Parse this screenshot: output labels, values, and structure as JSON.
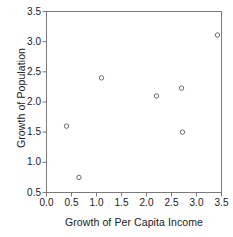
{
  "chart_data": {
    "type": "scatter",
    "title": "",
    "xlabel": "Growth of Per Capita Income",
    "ylabel": "Growth of Population",
    "xlim": [
      0.0,
      3.5
    ],
    "ylim": [
      0.5,
      3.5
    ],
    "xticks": [
      "0.0",
      "0.5",
      "1.0",
      "1.5",
      "2.0",
      "2.5",
      "3.0",
      "3.5"
    ],
    "yticks": [
      "0.5",
      "1.0",
      "1.5",
      "2.0",
      "2.5",
      "3.0",
      "3.5"
    ],
    "xtick_values": [
      0.0,
      0.5,
      1.0,
      1.5,
      2.0,
      2.5,
      3.0,
      3.5
    ],
    "ytick_values": [
      0.5,
      1.0,
      1.5,
      2.0,
      2.5,
      3.0,
      3.5
    ],
    "grid": false,
    "legend": null,
    "marker": "open-circle",
    "marker_color": "#6b6b6b",
    "axis_color": "#7a7a7a",
    "background": "#ffffff",
    "x": [
      0.4,
      0.65,
      1.1,
      2.2,
      2.7,
      2.72,
      3.42
    ],
    "y": [
      1.6,
      0.75,
      2.4,
      2.1,
      2.23,
      1.5,
      3.11
    ],
    "points": [
      {
        "x": 0.4,
        "y": 1.6
      },
      {
        "x": 0.65,
        "y": 0.75
      },
      {
        "x": 1.1,
        "y": 2.4
      },
      {
        "x": 2.2,
        "y": 2.1
      },
      {
        "x": 2.7,
        "y": 2.23
      },
      {
        "x": 2.72,
        "y": 1.5
      },
      {
        "x": 3.42,
        "y": 3.11
      }
    ]
  },
  "axes": {
    "x_title": "Growth of Per Capita Income",
    "y_title": "Growth of Population"
  }
}
